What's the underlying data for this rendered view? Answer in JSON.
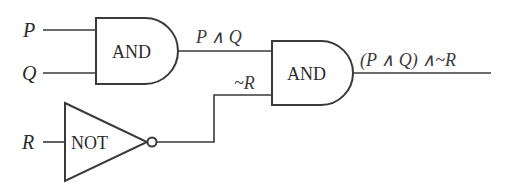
{
  "diagram": {
    "title": "",
    "colors": {
      "line": "#3a3a3a",
      "text": "#2a2a2a",
      "background": "#ffffff"
    },
    "inputs": [
      {
        "id": "P",
        "label": "P"
      },
      {
        "id": "Q",
        "label": "Q"
      },
      {
        "id": "R",
        "label": "R"
      }
    ],
    "gates": [
      {
        "id": "and1",
        "type": "AND",
        "label": "AND",
        "inputs": [
          "P",
          "Q"
        ],
        "output_label": "P ∧ Q"
      },
      {
        "id": "not1",
        "type": "NOT",
        "label": "NOT",
        "inputs": [
          "R"
        ],
        "output_label": "~R"
      },
      {
        "id": "and2",
        "type": "AND",
        "label": "AND",
        "inputs": [
          "and1",
          "not1"
        ],
        "output_label": "(P ∧ Q) ∧~R"
      }
    ]
  }
}
